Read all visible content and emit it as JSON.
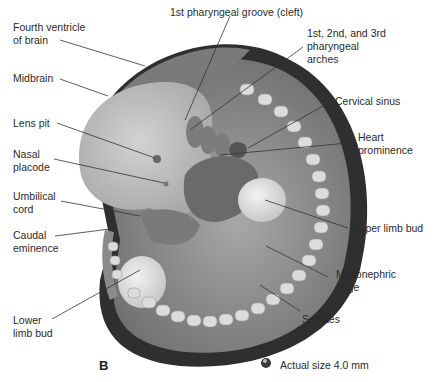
{
  "figure": {
    "panel_label": "B",
    "size_note": "Actual size 4.0 mm",
    "labels": {
      "fourth_ventricle": "Fourth ventricle\nof brain",
      "midbrain": "Midbrain",
      "lens_pit": "Lens pit",
      "nasal_placode": "Nasal\nplacode",
      "umbilical_cord": "Umbilical\ncord",
      "caudal_eminence": "Caudal\neminence",
      "lower_limb_bud": "Lower\nlimb bud",
      "pharyngeal_groove": "1st pharyngeal groove (cleft)",
      "pharyngeal_arches": "1st, 2nd, and 3rd\npharyngeal\narches",
      "cervical_sinus": "Cervical sinus",
      "heart_prominence": "Heart\nprominence",
      "upper_limb_bud": "Upper limb bud",
      "mesonephric_ridge": "Mesonephric\nridge",
      "somites": "Somites"
    },
    "colors": {
      "outer_rim": "#2e2e2e",
      "body": "#9a9a9a",
      "head": "#c4c4c4",
      "limb_bud": "#e2e2e2",
      "somite": "#dcdcdc",
      "leader_line": "#333333"
    }
  }
}
